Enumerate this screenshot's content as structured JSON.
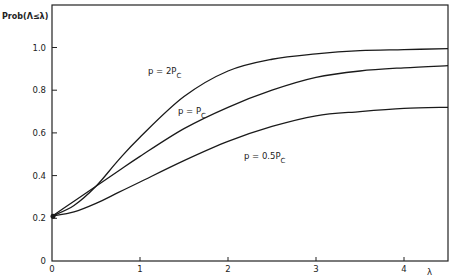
{
  "chart_data": {
    "type": "line",
    "title": "",
    "xlabel": "λ",
    "ylabel": "Prob(Λ≤λ)",
    "xlim": [
      0,
      4.5
    ],
    "ylim": [
      0,
      1.05
    ],
    "grid": false,
    "legend": "inline labels on curves",
    "x_ticks": [
      "0",
      "1",
      "2",
      "3",
      "4"
    ],
    "y_ticks": [
      "0",
      "0.2",
      "0.4",
      "0.6",
      "0.8",
      "1.0"
    ],
    "x": [
      0,
      0.25,
      0.5,
      0.75,
      1.0,
      1.5,
      2.0,
      2.5,
      3.0,
      3.5,
      4.0,
      4.5
    ],
    "series": [
      {
        "name": "p = 2P_C",
        "label_main": "p = 2P",
        "label_sub": "C",
        "values": [
          0.21,
          0.26,
          0.35,
          0.47,
          0.58,
          0.77,
          0.89,
          0.945,
          0.97,
          0.985,
          0.99,
          0.995
        ]
      },
      {
        "name": "p = P_C",
        "label_main": "p = P",
        "label_sub": "C",
        "values": [
          0.21,
          0.28,
          0.35,
          0.42,
          0.49,
          0.62,
          0.72,
          0.8,
          0.86,
          0.89,
          0.905,
          0.915
        ]
      },
      {
        "name": "p = 0.5P_C",
        "label_main": "p = 0.5P",
        "label_sub": "C",
        "values": [
          0.21,
          0.23,
          0.27,
          0.32,
          0.37,
          0.47,
          0.56,
          0.63,
          0.68,
          0.7,
          0.715,
          0.72
        ]
      }
    ]
  }
}
